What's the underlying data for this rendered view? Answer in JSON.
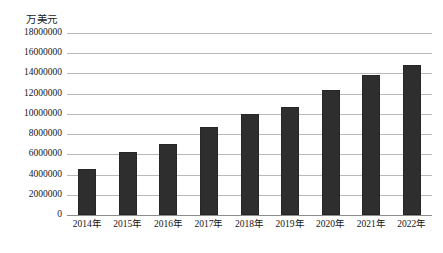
{
  "chart_data": {
    "type": "bar",
    "title": "",
    "unit_label": "万美元",
    "xlabel": "",
    "ylabel": "万美元",
    "categories": [
      "2014年",
      "2015年",
      "2016年",
      "2017年",
      "2018年",
      "2019年",
      "2020年",
      "2021年",
      "2022年"
    ],
    "values": [
      4600000,
      6250000,
      7000000,
      8700000,
      10000000,
      10700000,
      12400000,
      13800000,
      14800000
    ],
    "ylim": [
      0,
      18000000
    ],
    "y_ticks": [
      0,
      2000000,
      4000000,
      6000000,
      8000000,
      10000000,
      12000000,
      14000000,
      16000000,
      18000000
    ],
    "y_tick_labels": [
      "0",
      "2000000",
      "4000000",
      "6000000",
      "8000000",
      "10000000",
      "12000000",
      "14000000",
      "16000000",
      "18000000"
    ],
    "grid": true,
    "legend": false,
    "legend_position": "none",
    "series": [
      {
        "name": "",
        "color": "#2e2e2e",
        "values": [
          4600000,
          6250000,
          7000000,
          8700000,
          10000000,
          10700000,
          12400000,
          13800000,
          14800000
        ]
      }
    ]
  }
}
